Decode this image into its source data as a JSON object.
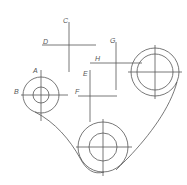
{
  "diagram": {
    "type": "engineering-drawing",
    "line_color": "#555555",
    "background": "#ffffff",
    "labels": {
      "A": "A",
      "B": "B",
      "C": "C",
      "D": "D",
      "E": "E",
      "F": "F",
      "G": "G",
      "H": "H"
    },
    "circles": [
      {
        "name": "left-pulley",
        "cx": 41,
        "cy": 95,
        "r_outer": 18,
        "r_inner": 8
      },
      {
        "name": "right-pulley",
        "cx": 155,
        "cy": 72,
        "r_outer": 24,
        "r_inner": 18
      },
      {
        "name": "bottom-pulley",
        "cx": 103,
        "cy": 147,
        "r_outer": 25,
        "r_inner": 14
      }
    ]
  }
}
